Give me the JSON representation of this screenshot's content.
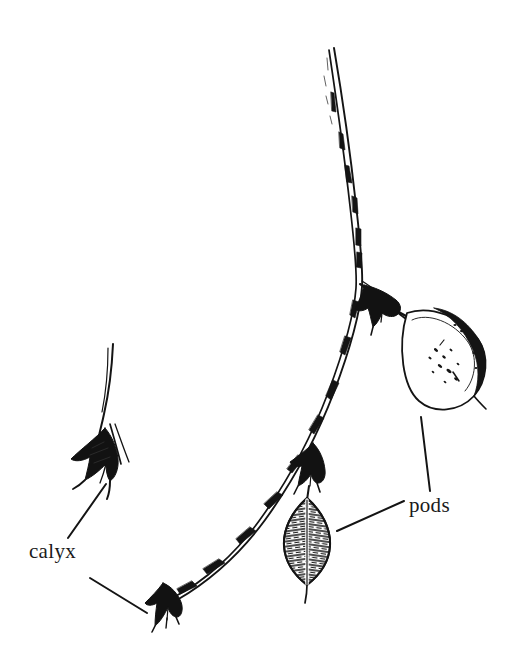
{
  "figure": {
    "kind": "botanical-line-drawing",
    "background_color": "#ffffff",
    "ink_color": "#121212",
    "width": 507,
    "height": 663
  },
  "labels": [
    {
      "id": "calyx",
      "text": "calyx",
      "x": 29,
      "y": 541,
      "font_size": 21,
      "leader_lines": [
        {
          "from_x": 68,
          "from_y": 538,
          "to_x": 106,
          "to_y": 484
        },
        {
          "from_x": 90,
          "from_y": 578,
          "to_x": 147,
          "to_y": 613
        }
      ]
    },
    {
      "id": "pods",
      "text": "pods",
      "x": 409,
      "y": 495,
      "font_size": 21,
      "leader_lines": [
        {
          "from_x": 404,
          "from_y": 501,
          "to_x": 337,
          "to_y": 531
        },
        {
          "from_x": 430,
          "from_y": 491,
          "to_x": 421,
          "to_y": 417
        }
      ]
    }
  ],
  "parts": [
    {
      "name": "main-stem",
      "type": "stem",
      "start_x": 332,
      "start_y": 48,
      "end_x": 168,
      "end_y": 592
    },
    {
      "name": "upper-pod",
      "type": "pod",
      "center_x": 445,
      "center_y": 363,
      "length": 98,
      "width": 52,
      "rotation_deg": 40
    },
    {
      "name": "upper-pod-calyx",
      "type": "calyx",
      "center_x": 382,
      "center_y": 303
    },
    {
      "name": "lower-pod",
      "type": "pod",
      "center_x": 307,
      "center_y": 540,
      "length": 82,
      "width": 46,
      "rotation_deg": 0
    },
    {
      "name": "lower-pod-calyx",
      "type": "calyx",
      "center_x": 311,
      "center_y": 470
    },
    {
      "name": "bottom-calyx",
      "type": "calyx",
      "center_x": 166,
      "center_y": 604
    },
    {
      "name": "detached-calyx",
      "type": "calyx",
      "center_x": 98,
      "center_y": 452
    },
    {
      "name": "detached-calyx-stalk",
      "type": "stem",
      "start_x": 112,
      "start_y": 344,
      "end_x": 100,
      "end_y": 430
    }
  ]
}
